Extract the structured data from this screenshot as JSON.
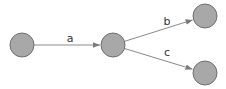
{
  "diagram": {
    "type": "directed-graph",
    "colors": {
      "node_fill": "#a8a8a8",
      "node_stroke": "#6e6e6e",
      "edge": "#8a8a8a",
      "label": "#333333"
    },
    "nodes": [
      {
        "id": "n1",
        "cx": 22,
        "cy": 45,
        "r": 12
      },
      {
        "id": "n2",
        "cx": 113,
        "cy": 45,
        "r": 12
      },
      {
        "id": "n3",
        "cx": 205,
        "cy": 16,
        "r": 12
      },
      {
        "id": "n4",
        "cx": 205,
        "cy": 73,
        "r": 12
      }
    ],
    "edges": [
      {
        "from": "n1",
        "to": "n2",
        "label": "a",
        "label_x": 70,
        "label_y": 42
      },
      {
        "from": "n2",
        "to": "n3",
        "label": "b",
        "label_x": 167,
        "label_y": 25
      },
      {
        "from": "n2",
        "to": "n4",
        "label": "c",
        "label_x": 167,
        "label_y": 56
      }
    ]
  }
}
